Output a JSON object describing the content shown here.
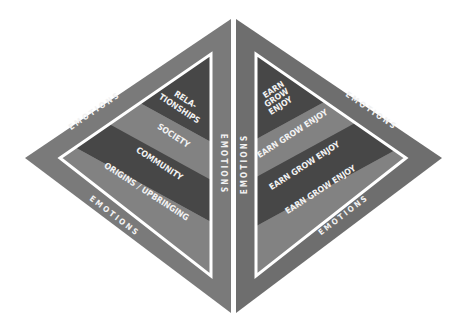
{
  "colors": {
    "background": "#ffffff",
    "outer_band": "#7a7a7a",
    "outer_band_right": "#6e6e6e",
    "divider": "#ffffff",
    "band_dark": "#474747",
    "band_light": "#828282",
    "text": "#f2f2f2"
  },
  "left_triangle": {
    "border_labels": [
      "EMOTIONS",
      "EMOTIONS",
      "EMOTIONS"
    ],
    "bands": [
      {
        "label_line1": "RELA-",
        "label_line2": "TIONSHIPS",
        "tone": "dark"
      },
      {
        "label": "SOCIETY",
        "tone": "light"
      },
      {
        "label": "COMMUNITY",
        "tone": "dark"
      },
      {
        "label": "ORIGINS / UPBRINGING",
        "tone": "light"
      }
    ]
  },
  "right_triangle": {
    "border_labels": [
      "EMOTIONS",
      "EMOTIONS",
      "EMOTIONS"
    ],
    "bands": [
      {
        "label_line1": "EARN",
        "label_line2": "GROW",
        "label_line3": "ENJOY",
        "tone": "dark"
      },
      {
        "label": "EARN GROW ENJOY",
        "tone": "light"
      },
      {
        "label": "EARN GROW ENJOY",
        "tone": "dark"
      },
      {
        "label": "EARN GROW ENJOY",
        "tone": "light"
      }
    ]
  }
}
